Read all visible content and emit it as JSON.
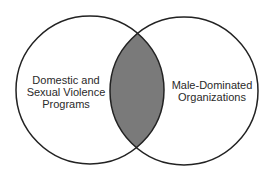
{
  "diagram": {
    "type": "venn",
    "colors": {
      "background": "#ffffff",
      "stroke": "#222222",
      "intersection_fill": "#7a7a7a",
      "text": "#2a2a2a"
    },
    "sets": [
      {
        "id": "left",
        "label_lines": [
          "Domestic and",
          "Sexual Violence",
          "Programs"
        ]
      },
      {
        "id": "right",
        "label_lines": [
          "Male-Dominated",
          "Organizations"
        ]
      }
    ],
    "intersection": {
      "shaded": true,
      "label": ""
    }
  }
}
